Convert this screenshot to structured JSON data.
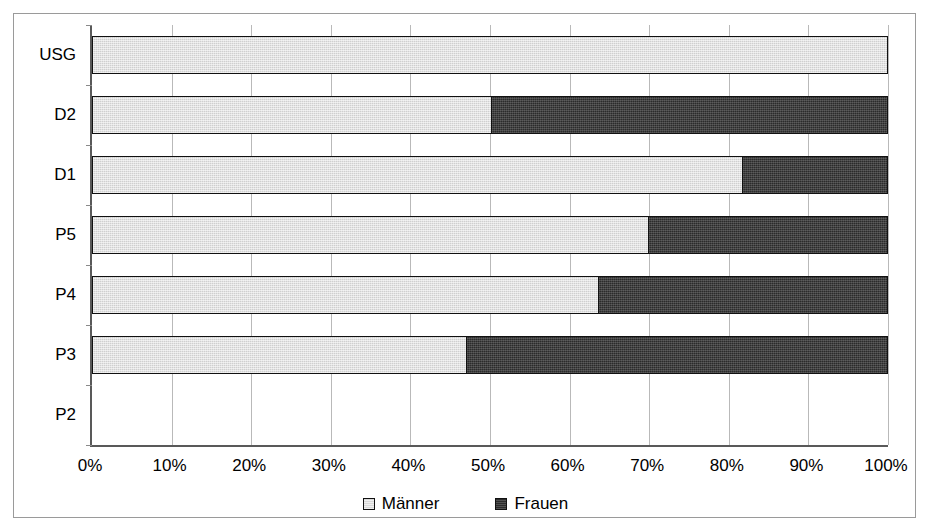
{
  "chart_data": {
    "type": "bar",
    "orientation": "horizontal",
    "stacked": true,
    "stack_mode": "percent",
    "title": "",
    "subtitle": "",
    "xlabel": "",
    "ylabel": "",
    "xlim": [
      0,
      100
    ],
    "grid": true,
    "legend_position": "bottom",
    "categories": [
      "P2",
      "P3",
      "P4",
      "P5",
      "D1",
      "D2",
      "USG"
    ],
    "categories_top_to_bottom": [
      "USG",
      "D2",
      "D1",
      "P5",
      "P4",
      "P3",
      "P2"
    ],
    "x_tick_labels": [
      "0%",
      "10%",
      "20%",
      "30%",
      "40%",
      "50%",
      "60%",
      "70%",
      "80%",
      "90%",
      "100%"
    ],
    "x_tick_values": [
      0,
      10,
      20,
      30,
      40,
      50,
      60,
      70,
      80,
      90,
      100
    ],
    "series": [
      {
        "name": "Männer",
        "color": "#cfcfcf",
        "values_top_to_bottom": [
          100,
          50.3,
          81.8,
          70.0,
          63.8,
          47.2,
          0
        ]
      },
      {
        "name": "Frauen",
        "color": "#2b2b2b",
        "values_top_to_bottom": [
          0,
          49.7,
          18.2,
          30.0,
          36.2,
          52.8,
          0
        ]
      }
    ],
    "rows": [
      {
        "category": "USG",
        "men": 100,
        "women": 0
      },
      {
        "category": "D2",
        "men": 50.3,
        "women": 49.7
      },
      {
        "category": "D1",
        "men": 81.8,
        "women": 18.2
      },
      {
        "category": "P5",
        "men": 70.0,
        "women": 30.0
      },
      {
        "category": "P4",
        "men": 63.8,
        "women": 36.2
      },
      {
        "category": "P3",
        "men": 47.2,
        "women": 52.8
      },
      {
        "category": "P2",
        "men": 0,
        "women": 0
      }
    ],
    "legend": [
      {
        "label": "Männer",
        "swatch": "light-gray-square",
        "color": "#cfcfcf"
      },
      {
        "label": "Frauen",
        "swatch": "dark-square",
        "color": "#2b2b2b"
      }
    ]
  }
}
